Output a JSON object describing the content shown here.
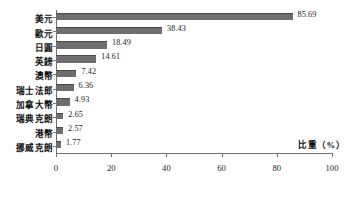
{
  "chart_data": {
    "type": "bar",
    "orientation": "horizontal",
    "title": "",
    "xlabel": "比重（%）",
    "ylabel": "",
    "xlim": [
      0,
      100
    ],
    "ylim": null,
    "grid": false,
    "legend": null,
    "xticks": [
      "0",
      "20",
      "40",
      "60",
      "80",
      "100"
    ],
    "xtick_values": [
      0,
      20,
      40,
      60,
      80,
      100
    ],
    "categories": [
      "美元",
      "歐元",
      "日圓",
      "英鎊",
      "澳幣",
      "瑞士法郎",
      "加拿大幣",
      "瑞典克朗",
      "港幣",
      "挪威克朗"
    ],
    "values": [
      85.69,
      38.43,
      18.49,
      14.61,
      7.42,
      6.36,
      4.93,
      2.65,
      2.57,
      1.77
    ],
    "value_labels": [
      "85.69",
      "38.43",
      "18.49",
      "14.61",
      "7.42",
      "6.36",
      "4.93",
      "2.65",
      "2.57",
      "1.77"
    ],
    "series": [
      {
        "name": "比重",
        "values": [
          85.69,
          38.43,
          18.49,
          14.61,
          7.42,
          6.36,
          4.93,
          2.65,
          2.57,
          1.77
        ]
      }
    ],
    "colors": {
      "bar": "#6e6e6e",
      "bar_edge": "#4a4a4a",
      "axis": "#6f6f6f",
      "text": "#1a1a1a",
      "background": "#ffffff"
    }
  }
}
